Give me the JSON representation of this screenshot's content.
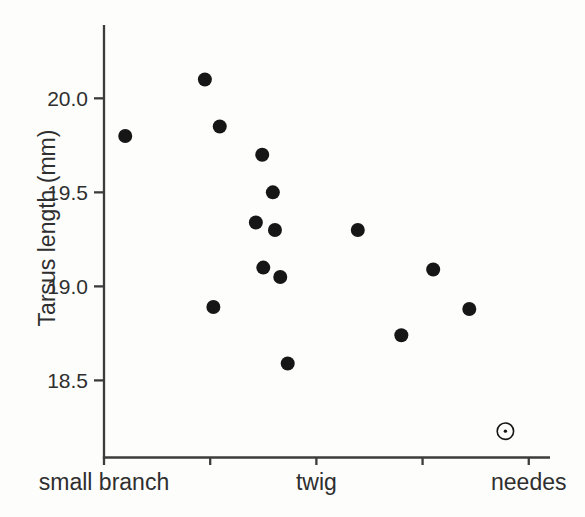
{
  "figure": {
    "background": "#fdfdfc"
  },
  "chart_data": {
    "type": "scatter",
    "title": "",
    "xlabel": "",
    "ylabel": "Tarsus length (mm)",
    "xlim": [
      0,
      4.2
    ],
    "ylim": [
      18.09,
      20.39
    ],
    "grid": false,
    "legend": "none",
    "axis_color": "#3c3c3c",
    "marker_color": "#161616",
    "text_color": "#2f2f2f",
    "yticks": [
      {
        "value": 20.0,
        "label": "20.0"
      },
      {
        "value": 19.5,
        "label": "19.5"
      },
      {
        "value": 19.0,
        "label": "19.0"
      },
      {
        "value": 18.5,
        "label": "18.5"
      }
    ],
    "x_categories": [
      {
        "pos": 0,
        "label": "small branch"
      },
      {
        "pos": 1,
        "label": ""
      },
      {
        "pos": 2,
        "label": "twig"
      },
      {
        "pos": 3,
        "label": ""
      },
      {
        "pos": 4,
        "label": "needes"
      }
    ],
    "points": [
      {
        "x": 0.2,
        "y": 19.8,
        "marker": "filled"
      },
      {
        "x": 0.95,
        "y": 20.1,
        "marker": "filled"
      },
      {
        "x": 1.03,
        "y": 18.89,
        "marker": "filled"
      },
      {
        "x": 1.09,
        "y": 19.85,
        "marker": "filled"
      },
      {
        "x": 1.43,
        "y": 19.34,
        "marker": "filled"
      },
      {
        "x": 1.49,
        "y": 19.7,
        "marker": "filled"
      },
      {
        "x": 1.5,
        "y": 19.1,
        "marker": "filled"
      },
      {
        "x": 1.59,
        "y": 19.5,
        "marker": "filled"
      },
      {
        "x": 1.61,
        "y": 19.3,
        "marker": "filled"
      },
      {
        "x": 1.66,
        "y": 19.05,
        "marker": "filled"
      },
      {
        "x": 1.73,
        "y": 18.59,
        "marker": "filled"
      },
      {
        "x": 2.39,
        "y": 19.3,
        "marker": "filled"
      },
      {
        "x": 2.8,
        "y": 18.74,
        "marker": "filled"
      },
      {
        "x": 3.1,
        "y": 19.09,
        "marker": "filled"
      },
      {
        "x": 3.44,
        "y": 18.88,
        "marker": "filled"
      },
      {
        "x": 3.78,
        "y": 18.23,
        "marker": "open-dot"
      }
    ]
  }
}
